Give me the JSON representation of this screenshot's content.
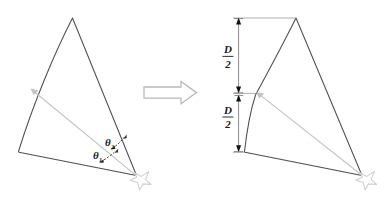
{
  "figure": {
    "background_color": "#ffffff",
    "outline_color": "#4d4d52",
    "accent_gray": "#c3c3c6",
    "dimension_color": "#6e6e73"
  },
  "left_panel": {
    "name": "source-wedge",
    "angle_labels": [
      {
        "symbol": "θ",
        "subscript": "2",
        "full": "θ2"
      },
      {
        "symbol": "θ",
        "subscript": "1",
        "full": "θ1"
      }
    ],
    "apex_marker": "star-burst",
    "radial_line": "gray-arrow-line"
  },
  "arrow": {
    "name": "transform-arrow",
    "direction": "right",
    "style": "hollow-block-arrow"
  },
  "right_panel": {
    "name": "result-wedge",
    "dimensions": [
      {
        "numerator": "D",
        "denominator": "2",
        "full": "D/2",
        "position": "upper"
      },
      {
        "numerator": "D",
        "denominator": "2",
        "full": "D/2",
        "position": "lower"
      }
    ],
    "apex_marker": "star-burst",
    "radial_line": "gray-arrow-line"
  }
}
